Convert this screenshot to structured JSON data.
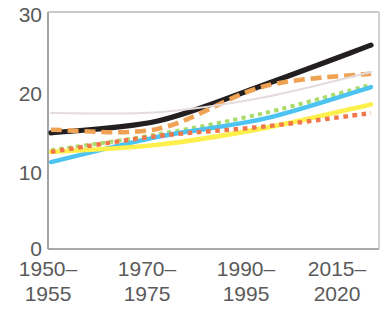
{
  "chart_data": {
    "type": "line",
    "title": "",
    "subtitle": "",
    "xlabel": "",
    "ylabel": "",
    "categories": [
      "1950–1955",
      "1970–1975",
      "1990–1995",
      "2015–2020"
    ],
    "category_lines": [
      [
        "1950–",
        "1955"
      ],
      [
        "1970–",
        "1975"
      ],
      [
        "1990–",
        "1995"
      ],
      [
        "2015–",
        "2020"
      ]
    ],
    "ylim": [
      0,
      30
    ],
    "xlim_categories": 4,
    "y_ticks": [
      0,
      10,
      20,
      30
    ],
    "y_tick_labels": [
      "0",
      "10",
      "20",
      "30"
    ],
    "grid": false,
    "legend": "none",
    "axis_color": "#8c8c8c",
    "plot_background": "#ffffff",
    "series": [
      {
        "name": "black-solid",
        "color": "#231f20",
        "style": "solid",
        "width": 5.2,
        "values": [
          14.7,
          16.2,
          20.8,
          25.8
        ]
      },
      {
        "name": "orange-dashed",
        "color": "#f0a254",
        "style": "dashed",
        "width": 4.6,
        "values": [
          15.1,
          15.2,
          20.6,
          22.2
        ]
      },
      {
        "name": "grey-faint",
        "color": "#e4dcdc",
        "style": "solid",
        "width": 2.0,
        "values": [
          17.2,
          17.3,
          19.2,
          22.4
        ]
      },
      {
        "name": "green-dotted",
        "color": "#a9dc6b",
        "style": "dotted",
        "width": 4.0,
        "values": [
          12.5,
          14.5,
          17.2,
          20.8
        ]
      },
      {
        "name": "lightblue-solid",
        "color": "#4cc3f0",
        "style": "solid",
        "width": 4.4,
        "values": [
          11.0,
          14.2,
          16.5,
          20.5
        ]
      },
      {
        "name": "yellow-solid",
        "color": "#fdf04c",
        "style": "solid",
        "width": 4.6,
        "values": [
          12.3,
          13.2,
          15.3,
          18.3
        ]
      },
      {
        "name": "red-dotted",
        "color": "#f2764a",
        "style": "dotted",
        "width": 4.4,
        "values": [
          12.3,
          14.3,
          15.5,
          17.2
        ]
      }
    ]
  },
  "axes": {
    "y_labels": [
      "30",
      "20",
      "10",
      "0"
    ],
    "x_labels": [
      {
        "top": "1950–",
        "bottom": "1955"
      },
      {
        "top": "1970–",
        "bottom": "1975"
      },
      {
        "top": "1990–",
        "bottom": "1995"
      },
      {
        "top": "2015–",
        "bottom": "2020"
      }
    ]
  }
}
